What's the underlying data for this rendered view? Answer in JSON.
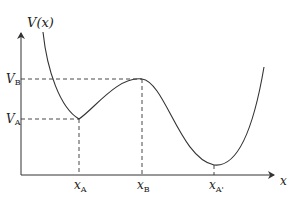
{
  "diagram": {
    "y_axis_label": "V(x)",
    "x_axis_label": "x",
    "y_ticks": [
      {
        "main": "V",
        "sub": "B",
        "y": 79
      },
      {
        "main": "V",
        "sub": "A",
        "y": 119
      }
    ],
    "x_ticks": [
      {
        "main": "x",
        "sub": "A",
        "x": 79
      },
      {
        "main": "x",
        "sub": "B",
        "x": 142
      },
      {
        "main": "x",
        "sub": "A'",
        "x": 214
      }
    ],
    "points": {
      "local_min_A": {
        "x": 79,
        "y": 119
      },
      "local_max_B": {
        "x": 142,
        "y": 79
      },
      "global_min_A_prime": {
        "x": 214,
        "y": 165
      }
    },
    "colors": {
      "curve": "#333333",
      "axis": "#333333",
      "dashed": "#333333"
    }
  }
}
